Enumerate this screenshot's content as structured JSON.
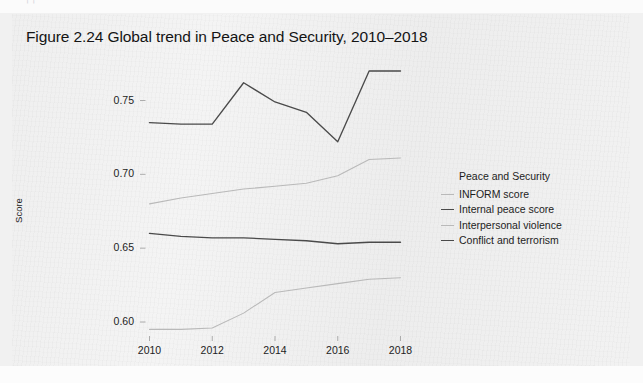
{
  "page": {
    "ghost_top_text": "· ¡ ¡ ·· ··    ·      ·      ·      ·      ·      ·"
  },
  "figure": {
    "title": "Figure 2.24  Global trend in Peace and Security, 2010–2018"
  },
  "legend": {
    "title": "Peace and Security",
    "entries": [
      {
        "label": "INFORM score",
        "color": "#b9b9b9"
      },
      {
        "label": "Internal peace score",
        "color": "#4a4a4a"
      },
      {
        "label": "Interpersonal violence",
        "color": "#b9b9b9"
      },
      {
        "label": "Conflict and terrorism",
        "color": "#4a4a4a"
      }
    ]
  },
  "axes": {
    "ylabel": "Score",
    "ytick_labels": [
      "0.75",
      "0.70",
      "0.65",
      "0.60"
    ],
    "ytick_values": [
      0.75,
      0.7,
      0.65,
      0.6
    ],
    "xtick_labels": [
      "2010",
      "2012",
      "2014",
      "2016",
      "2018"
    ],
    "xtick_values": [
      2010,
      2012,
      2014,
      2016,
      2018
    ]
  },
  "chart_data": {
    "type": "line",
    "title": "Figure 2.24  Global trend in Peace and Security, 2010–2018",
    "xlabel": "",
    "ylabel": "Score",
    "x": [
      2010,
      2011,
      2012,
      2013,
      2014,
      2015,
      2016,
      2017,
      2018
    ],
    "xlim": [
      2010,
      2018
    ],
    "ylim": [
      0.583,
      0.778
    ],
    "grid": false,
    "legend_position": "right",
    "legend_title": "Peace and Security",
    "series": [
      {
        "name": "INFORM score",
        "color": "#b9b9b9",
        "values": [
          0.68,
          0.684,
          0.687,
          0.69,
          0.692,
          0.694,
          0.699,
          0.71,
          0.711
        ]
      },
      {
        "name": "Internal peace score",
        "color": "#4a4a4a",
        "values": [
          0.735,
          0.734,
          0.734,
          0.762,
          0.749,
          0.742,
          0.722,
          0.77,
          0.77
        ]
      },
      {
        "name": "Interpersonal violence",
        "color": "#b9b9b9",
        "values": [
          0.595,
          0.595,
          0.596,
          0.606,
          0.62,
          0.623,
          0.626,
          0.629,
          0.63
        ]
      },
      {
        "name": "Conflict and terrorism",
        "color": "#4a4a4a",
        "values": [
          0.66,
          0.658,
          0.657,
          0.657,
          0.656,
          0.655,
          0.653,
          0.654,
          0.654
        ]
      }
    ]
  }
}
